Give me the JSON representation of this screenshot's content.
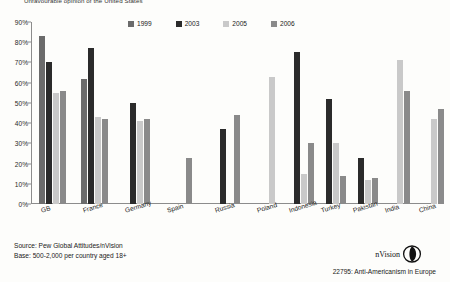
{
  "title": "Unfavourable opinion of the United States",
  "legend": {
    "position": "top-center",
    "entries": [
      {
        "label": "1999",
        "color": "#6b6b6b"
      },
      {
        "label": "2003",
        "color": "#2b2b2b"
      },
      {
        "label": "2005",
        "color": "#c9c9c9"
      },
      {
        "label": "2006",
        "color": "#8a8a8a"
      }
    ]
  },
  "yaxis": {
    "ticks": [
      "0%",
      "10%",
      "20%",
      "30%",
      "40%",
      "50%",
      "60%",
      "70%",
      "80%",
      "90%"
    ],
    "min": 0,
    "max": 90
  },
  "footer": {
    "source": "Source: Pew Global Attitudes/nVision",
    "base": "Base: 500-2,000 per country aged 18+"
  },
  "brand": {
    "name": "nVision"
  },
  "caption": "22795: Anti-Americanism in Europe",
  "chart_data": {
    "type": "bar",
    "title": "Unfavourable opinion of the United States",
    "xlabel": "",
    "ylabel": "",
    "ylim": [
      0,
      90
    ],
    "grid": false,
    "legend_position": "top-center",
    "categories": [
      "GB",
      "France",
      "Germany",
      "Spain",
      "Russia",
      "Poland",
      "Indonesia",
      "Turkey",
      "Pakistan",
      "India",
      "China",
      "Canada"
    ],
    "series": [
      {
        "name": "1999",
        "color": "#6b6b6b",
        "values": [
          83,
          62,
          null,
          null,
          null,
          null,
          null,
          null,
          null,
          null,
          null,
          null
        ]
      },
      {
        "name": "2003",
        "color": "#2b2b2b",
        "values": [
          70,
          77,
          50,
          null,
          37,
          null,
          75,
          52,
          23,
          null,
          null,
          72
        ]
      },
      {
        "name": "2005",
        "color": "#c9c9c9",
        "values": [
          55,
          43,
          41,
          null,
          null,
          63,
          15,
          30,
          12,
          71,
          42,
          null
        ]
      },
      {
        "name": "2006",
        "color": "#8a8a8a",
        "values": [
          56,
          42,
          42,
          23,
          44,
          null,
          30,
          14,
          13,
          56,
          47,
          60
        ]
      }
    ]
  }
}
